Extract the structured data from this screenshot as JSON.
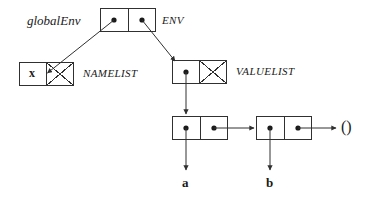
{
  "diagram": {
    "type": "box-and-pointer",
    "stroke_color": "#303030",
    "text_color": "#1a1a1a",
    "background": "#ffffff",
    "labels": {
      "global_env": "globalEnv",
      "env": "ENV",
      "namelist": "NAMELIST",
      "valuelist": "VALUELIST",
      "name_x": "x",
      "value_a": "a",
      "value_b": "b",
      "nil": "()"
    },
    "nodes": [
      {
        "id": "env-cell",
        "name": "env-cons-cell",
        "label": "ENV",
        "cells": [
          {
            "kind": "pointer",
            "target": "namelist-cell"
          },
          {
            "kind": "pointer",
            "target": "valuelist-cell"
          }
        ]
      },
      {
        "id": "namelist-cell",
        "name": "namelist-cons-cell",
        "label": "NAMELIST",
        "cells": [
          {
            "kind": "atom",
            "value": "x"
          },
          {
            "kind": "nil"
          }
        ]
      },
      {
        "id": "valuelist-cell",
        "name": "valuelist-cons-cell",
        "label": "VALUELIST",
        "cells": [
          {
            "kind": "pointer",
            "target": "pair-a"
          },
          {
            "kind": "nil"
          }
        ]
      },
      {
        "id": "pair-a",
        "name": "value-pair-a",
        "cells": [
          {
            "kind": "pointer",
            "target": "a"
          },
          {
            "kind": "pointer",
            "target": "pair-b"
          }
        ]
      },
      {
        "id": "pair-b",
        "name": "value-pair-b",
        "cells": [
          {
            "kind": "pointer",
            "target": "b"
          },
          {
            "kind": "pointer",
            "target": "nil"
          }
        ]
      }
    ],
    "edges": [
      {
        "from": "env-cell.car",
        "to": "namelist-cell",
        "style": "diagonal-down-left"
      },
      {
        "from": "env-cell.cdr",
        "to": "valuelist-cell",
        "style": "diagonal-down-right"
      },
      {
        "from": "valuelist-cell.car",
        "to": "pair-a",
        "style": "vertical-down"
      },
      {
        "from": "pair-a.car",
        "to": "a",
        "style": "vertical-down"
      },
      {
        "from": "pair-a.cdr",
        "to": "pair-b",
        "style": "horizontal-right"
      },
      {
        "from": "pair-b.car",
        "to": "b",
        "style": "vertical-down"
      },
      {
        "from": "pair-b.cdr",
        "to": "nil",
        "style": "horizontal-right"
      }
    ]
  }
}
